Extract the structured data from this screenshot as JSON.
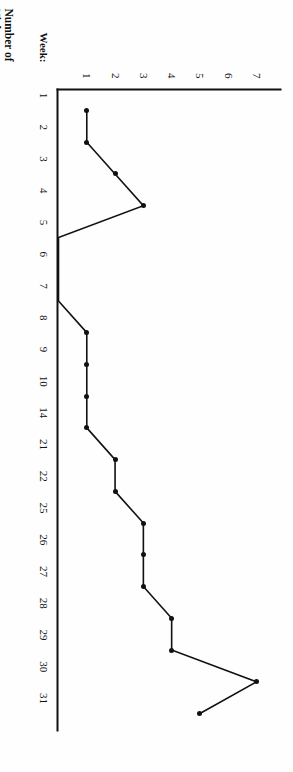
{
  "chart_data": {
    "type": "line",
    "title": "",
    "xlabel": "Week:",
    "ylabel": "Number of Nights Without Valium",
    "ylabel_lines": [
      "Number of",
      "Nights",
      "Without",
      "Valium"
    ],
    "categories": [
      "1",
      "2",
      "3",
      "4",
      "5",
      "6",
      "7",
      "8",
      "9",
      "10",
      "14",
      "21",
      "22",
      "25",
      "26",
      "27",
      "28",
      "29",
      "30",
      "31"
    ],
    "values": [
      1,
      1,
      2,
      3,
      0,
      null,
      0,
      1,
      1,
      1,
      1,
      2,
      2,
      3,
      3,
      3,
      4,
      4,
      7,
      5
    ],
    "yticks": [
      "1",
      "2",
      "3",
      "4",
      "5",
      "6",
      "7"
    ],
    "ylim": [
      0,
      7.6
    ],
    "grid": false,
    "legend": null,
    "marker": "filled-circle",
    "line_color": "#111111",
    "orientation": "rotated-90-clockwise"
  },
  "figure": {
    "week_axis_caption": "Week:",
    "value_axis_caption": "Number of Nights Without Valium"
  }
}
